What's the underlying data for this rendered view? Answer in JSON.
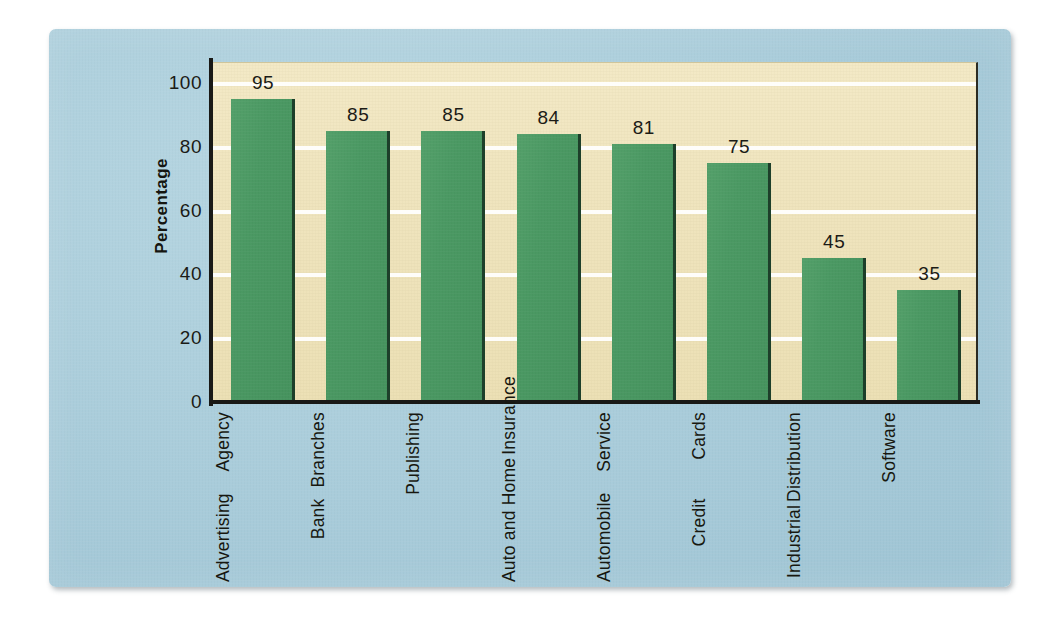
{
  "chart_data": {
    "type": "bar",
    "title": "",
    "subtitle": "",
    "xlabel": "",
    "ylabel": "Percentage",
    "ylim": [
      0,
      100
    ],
    "grid": true,
    "legend": null,
    "yticks": [
      "100",
      "80",
      "60",
      "40",
      "20",
      "0"
    ],
    "ytick_values": [
      100,
      80,
      60,
      40,
      20,
      0
    ],
    "categories": [
      "Advertising Agency",
      "Bank Branches",
      "Publishing",
      "Auto and Home Insurance",
      "Automobile Service",
      "Credit Cards",
      "Industrial Distribution",
      "Software"
    ],
    "category_lines": [
      [
        "Advertising",
        "Agency"
      ],
      [
        "Bank",
        "Branches"
      ],
      [
        "Publishing"
      ],
      [
        "Auto and Home",
        "Insurance"
      ],
      [
        "Automobile",
        "Service"
      ],
      [
        "Credit",
        "Cards"
      ],
      [
        "Industrial",
        "Distribution"
      ],
      [
        "Software"
      ]
    ],
    "values": [
      95,
      85,
      85,
      84,
      81,
      75,
      45,
      35
    ],
    "value_labels": [
      "95",
      "85",
      "85",
      "84",
      "81",
      "75",
      "45",
      "35"
    ],
    "colors": {
      "bar": "#4b9963",
      "bar_edge": "#1d3f2a",
      "plot_background": "#efe4bd",
      "panel_background": "#a9ccda",
      "gridline": "#ffffff",
      "axis": "#191916",
      "text": "#1b1b16",
      "page_background": "#ffffff"
    }
  }
}
